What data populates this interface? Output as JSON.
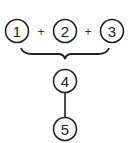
{
  "diagram": {
    "nodes": [
      {
        "id": "1",
        "label": "1"
      },
      {
        "id": "2",
        "label": "2"
      },
      {
        "id": "3",
        "label": "3"
      },
      {
        "id": "4",
        "label": "4"
      },
      {
        "id": "5",
        "label": "5"
      }
    ],
    "operators": [
      "+",
      "+"
    ],
    "edges": [
      {
        "from": "1+2+3",
        "to": "4",
        "type": "brace"
      },
      {
        "from": "4",
        "to": "5",
        "type": "line"
      }
    ]
  }
}
